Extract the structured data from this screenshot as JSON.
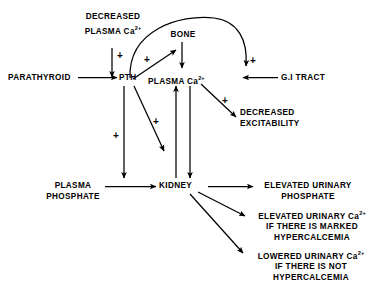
{
  "diagram": {
    "type": "flow-diagram",
    "bg_color": "#ffffff",
    "ink_color": "#000000"
  },
  "nodes": {
    "decreased_plasma_ca_line1": "DECREASED",
    "decreased_plasma_ca_line2": "PLASMA Ca",
    "decreased_plasma_ca_sup": "2+",
    "parathyroid": "PARATHYROID",
    "pth": "PTH",
    "bone": "BONE",
    "plasma_ca": "PLASMA  Ca",
    "plasma_ca_sup": "2+",
    "gi_tract": "G.I TRACT",
    "decreased_excitability_line1": "DECREASED",
    "decreased_excitability_line2": "EXCITABILITY",
    "plasma_phosphate_line1": "PLASMA",
    "plasma_phosphate_line2": "PHOSPHATE",
    "kidney": "KIDNEY",
    "elevated_urinary_phosphate_line1": "ELEVATED  URINARY",
    "elevated_urinary_phosphate_line2": "PHOSPHATE",
    "elevated_urinary_ca_line1": "ELEVATED  URINARY  Ca",
    "elevated_urinary_ca_sup": "2+",
    "elevated_urinary_ca_line2": "IF THERE IS MARKED",
    "elevated_urinary_ca_line3": "HYPERCALCEMIA",
    "lowered_urinary_ca_line1": "LOWERED  URINARY  Ca",
    "lowered_urinary_ca_sup": "2+",
    "lowered_urinary_ca_line2": "IF THERE IS NOT",
    "lowered_urinary_ca_line3": "HYPERCALCEMIA"
  },
  "signs": {
    "plus_decreased_ca_to_parathyroid": "+",
    "plus_pth_to_bone": "+",
    "plus_arc_to_gi": "+",
    "plus_plasma_ca_to_excitability": "+",
    "plus_pth_down_kidney": "+",
    "plus_pth_diag_kidney": "+"
  }
}
